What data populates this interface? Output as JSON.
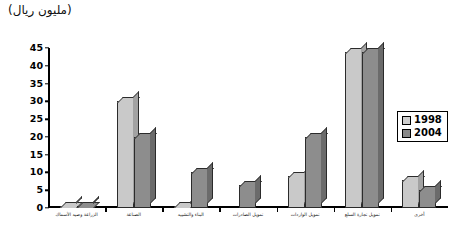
{
  "title": "(مليون ريال)",
  "legend": {
    "position": "right",
    "entries": [
      {
        "label": "1998",
        "color": "#cfcfcf"
      },
      {
        "label": "2004",
        "color": "#8a8a8a"
      }
    ]
  },
  "axis": {
    "y_ticks": [
      "45",
      "40",
      "35",
      "30",
      "25",
      "20",
      "15",
      "10",
      "5",
      "0"
    ]
  },
  "chart_data": {
    "type": "bar",
    "title": "(مليون ريال)",
    "xlabel": "",
    "ylabel": "",
    "ylim": [
      0,
      45
    ],
    "ytick_step": 5,
    "grid": false,
    "legend_position": "right",
    "categories": [
      "الزراعة وصيد الأسماك",
      "الصناعة",
      "البناء والتشييد",
      "تمويل الصادرات",
      "تمويل الواردات",
      "تمويل تجارة السلع",
      "أخرى"
    ],
    "series": [
      {
        "name": "1998",
        "color": "#cfcfcf",
        "values": [
          0.7,
          30,
          0.5,
          0,
          9,
          44,
          8
        ]
      },
      {
        "name": "2004",
        "color": "#8a8a8a",
        "values": [
          0.7,
          20,
          10,
          6.5,
          20,
          44,
          5
        ]
      }
    ]
  }
}
